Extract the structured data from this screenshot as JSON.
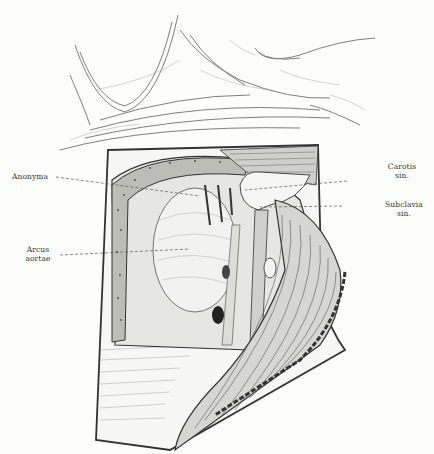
{
  "figure": {
    "labels": {
      "anonyma": "Anonyma",
      "arcus_line1": "Arcus",
      "arcus_line2": "aortae",
      "carotis_line1": "Carotis",
      "carotis_line2": "sin.",
      "subclavia_line1": "Subclavia",
      "subclavia_line2": "sin."
    },
    "colors": {
      "ink": "#2a2a2a",
      "paper": "#fdfdfc"
    }
  }
}
